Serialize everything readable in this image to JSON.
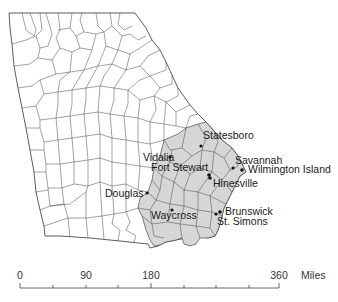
{
  "map": {
    "region": "Georgia counties",
    "highlight_color": "#d6d6d6",
    "border_color": "#333333",
    "cities": [
      {
        "name": "Statesboro",
        "label_x": 203,
        "label_y": 130,
        "dot_x": 201,
        "dot_y": 146
      },
      {
        "name": "Vidalia",
        "label_x": 143,
        "label_y": 153,
        "dot_x": 170,
        "dot_y": 157
      },
      {
        "name": "Fort Stewart",
        "label_x": 151,
        "label_y": 163,
        "dot_x": 209,
        "dot_y": 176
      },
      {
        "name": "Savannah",
        "label_x": 235,
        "label_y": 156,
        "dot_x": 233,
        "dot_y": 168
      },
      {
        "name": "Wilmington Island",
        "label_x": 248,
        "label_y": 164,
        "dot_x": 242,
        "dot_y": 170
      },
      {
        "name": "Hinesville",
        "label_x": 213,
        "label_y": 179,
        "dot_x": 210,
        "dot_y": 177
      },
      {
        "name": "Douglas",
        "label_x": 105,
        "label_y": 188,
        "dot_x": 147,
        "dot_y": 193
      },
      {
        "name": "Waycross",
        "label_x": 151,
        "label_y": 210,
        "dot_x": 172,
        "dot_y": 210
      },
      {
        "name": "Brunswick",
        "label_x": 225,
        "label_y": 206,
        "dot_x": 220,
        "dot_y": 212
      },
      {
        "name": "St. Simons",
        "label_x": 217,
        "label_y": 216,
        "dot_x": 216,
        "dot_y": 214
      }
    ]
  },
  "scale_bar": {
    "ticks": [
      "0",
      "90",
      "180",
      "360"
    ],
    "unit": "Miles"
  }
}
